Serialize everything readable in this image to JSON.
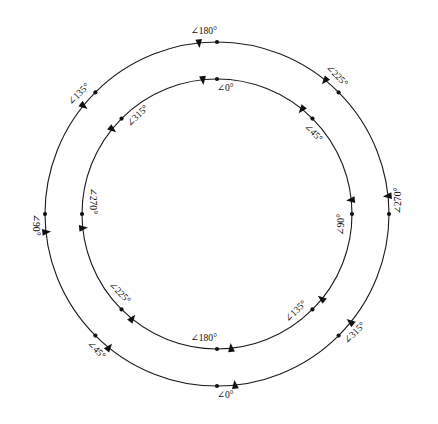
{
  "diagram": {
    "background_color": "#ffffff",
    "stroke_color": "#1a1a1a",
    "marker_color": "#111111",
    "label_color": "#101010",
    "center": {
      "x": 217,
      "y": 214
    },
    "angle_symbol": "∠",
    "degree_symbol": "°",
    "circles": [
      {
        "name": "outer-circle",
        "radius": 172,
        "label_side": "outside",
        "direction": "counterclockwise",
        "markers": [
          {
            "label": "∠180°",
            "value": 180,
            "position_deg": 90,
            "arrow": "left"
          },
          {
            "label": "∠225°",
            "value": 225,
            "position_deg": 45,
            "arrow": "up-left"
          },
          {
            "label": "∠270°",
            "value": 270,
            "position_deg": 0,
            "arrow": "up"
          },
          {
            "label": "∠315°",
            "value": 315,
            "position_deg": 315,
            "arrow": "up-right"
          },
          {
            "label": "∠0°",
            "value": 0,
            "position_deg": 270,
            "arrow": "right"
          },
          {
            "label": "∠45°",
            "value": 45,
            "position_deg": 225,
            "arrow": "down-right"
          },
          {
            "label": "∠90°",
            "value": 90,
            "position_deg": 180,
            "arrow": "down"
          },
          {
            "label": "∠135°",
            "value": 135,
            "position_deg": 135,
            "arrow": "down-left"
          }
        ]
      },
      {
        "name": "inner-circle",
        "radius": 135,
        "label_side": "inside",
        "direction": "counterclockwise",
        "markers": [
          {
            "label": "∠0°",
            "value": 0,
            "position_deg": 90,
            "arrow": "left"
          },
          {
            "label": "∠45°",
            "value": 45,
            "position_deg": 45,
            "arrow": "up-left"
          },
          {
            "label": "∠90°",
            "value": 90,
            "position_deg": 0,
            "arrow": "up"
          },
          {
            "label": "∠135°",
            "value": 135,
            "position_deg": 315,
            "arrow": "up-right"
          },
          {
            "label": "∠180°",
            "value": 180,
            "position_deg": 270,
            "arrow": "right"
          },
          {
            "label": "∠225°",
            "value": 225,
            "position_deg": 225,
            "arrow": "down-right"
          },
          {
            "label": "∠270°",
            "value": 270,
            "position_deg": 180,
            "arrow": "down"
          },
          {
            "label": "∠315°",
            "value": 315,
            "position_deg": 135,
            "arrow": "down-left"
          }
        ]
      }
    ]
  }
}
